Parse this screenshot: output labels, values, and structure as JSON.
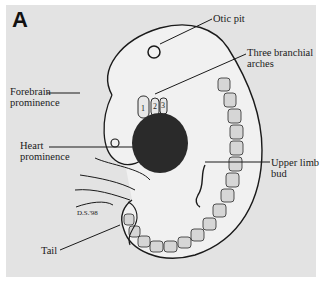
{
  "figure": {
    "panel_label": "A",
    "signature": "D.S.'98",
    "arch_numbers": [
      "1",
      "2",
      "3"
    ],
    "labels": {
      "otic_pit": "Otic pit",
      "branchial_arches_line1": "Three branchial",
      "branchial_arches_line2": "arches",
      "forebrain_line1": "Forebrain",
      "forebrain_line2": "prominence",
      "heart_line1": "Heart",
      "heart_line2": "prominence",
      "upper_limb_line1": "Upper limb",
      "upper_limb_line2": "bud",
      "tail": "Tail"
    },
    "colors": {
      "background": "#e3e3e3",
      "border": "#ffffff",
      "heart": "#2a2a2a",
      "ink": "#1a1a1a"
    }
  }
}
